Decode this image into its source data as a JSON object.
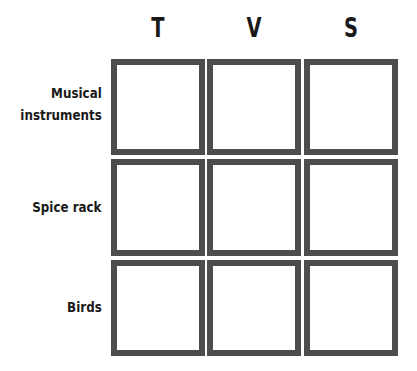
{
  "grid": {
    "columns": [
      {
        "label": "T"
      },
      {
        "label": "V"
      },
      {
        "label": "S"
      }
    ],
    "rows": [
      {
        "label_lines": [
          "Musical",
          "instruments"
        ]
      },
      {
        "label_lines": [
          "Spice rack"
        ]
      },
      {
        "label_lines": [
          "Birds"
        ]
      }
    ],
    "cells": [
      [
        "",
        "",
        ""
      ],
      [
        "",
        "",
        ""
      ],
      [
        "",
        "",
        ""
      ]
    ],
    "border_color": "#4d4d4d"
  }
}
